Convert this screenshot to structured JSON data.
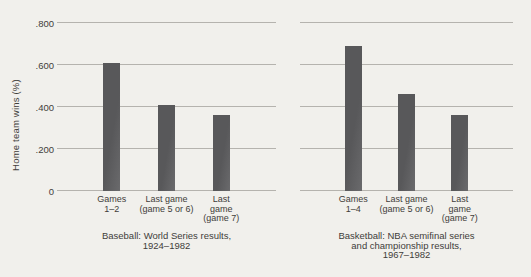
{
  "figure": {
    "ylabel": "Home team wins (%)",
    "colors": {
      "background": "#f1f0ec",
      "text": "#3f3d3a",
      "grid": "#b5b3ae",
      "bar": "#58585a"
    }
  },
  "chart_data": [
    {
      "type": "bar",
      "title": "Baseball: World Series results, 1924–1982",
      "caption_lines": [
        "Baseball: World Series results,",
        "1924–1982"
      ],
      "categories": [
        "Games 1–2",
        "Last game (game 5 or 6)",
        "Last game (game 7)"
      ],
      "category_lines": [
        [
          "Games",
          "1–2"
        ],
        [
          "Last game",
          "(game 5 or 6)"
        ],
        [
          "Last",
          "game",
          "(game 7)"
        ]
      ],
      "values": [
        0.61,
        0.41,
        0.36
      ],
      "xlabel": "",
      "ylabel": "Home team wins (%)",
      "ylim": [
        0,
        0.8
      ],
      "yticks": [
        0,
        0.2,
        0.4,
        0.6,
        0.8
      ],
      "ytick_labels": [
        "0",
        ".200",
        ".400",
        ".600",
        ".800"
      ],
      "grid": true,
      "legend": false
    },
    {
      "type": "bar",
      "title": "Basketball: NBA semifinal series and championship results, 1967–1982",
      "caption_lines": [
        "Basketball: NBA semifinal series",
        "and championship results,",
        "1967–1982"
      ],
      "categories": [
        "Games 1–4",
        "Last game (game 5 or 6)",
        "Last game (game 7)"
      ],
      "category_lines": [
        [
          "Games",
          "1–4"
        ],
        [
          "Last game",
          "(game 5 or 6)"
        ],
        [
          "Last",
          "game",
          "(game 7)"
        ]
      ],
      "values": [
        0.69,
        0.46,
        0.36
      ],
      "xlabel": "",
      "ylabel": "Home team wins (%)",
      "ylim": [
        0,
        0.8
      ],
      "yticks": [
        0,
        0.2,
        0.4,
        0.6,
        0.8
      ],
      "ytick_labels": [
        "0",
        ".200",
        ".400",
        ".600",
        ".800"
      ],
      "grid": true,
      "legend": false
    }
  ]
}
